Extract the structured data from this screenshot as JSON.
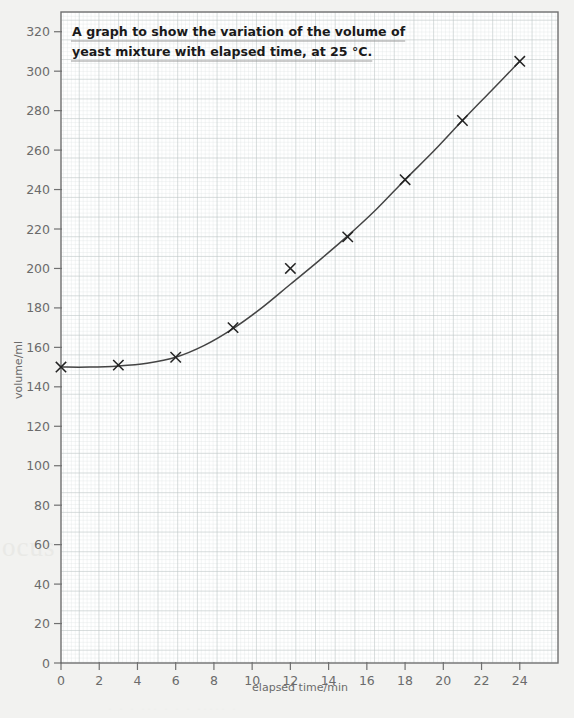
{
  "chart_data": {
    "type": "scatter",
    "title": "A graph to show the variation of the volume of yeast mixture with elapsed time, at 25 °C.",
    "title_lines": [
      "A graph to show the variation of the volume of",
      "yeast mixture with elapsed time, at 25 °C."
    ],
    "xlabel": "elapsed time/min",
    "ylabel": "volume/ml",
    "xlim": [
      0,
      26
    ],
    "ylim": [
      0,
      330
    ],
    "xticks": [
      0,
      2,
      4,
      6,
      8,
      10,
      12,
      14,
      16,
      18,
      20,
      22,
      24
    ],
    "yticks": [
      0,
      20,
      40,
      60,
      80,
      100,
      120,
      140,
      160,
      180,
      200,
      220,
      240,
      260,
      280,
      300,
      320
    ],
    "grid": "graph-paper minor 1 unit / major 5 unit",
    "legend": "none",
    "marker": "cross",
    "x": [
      0,
      3,
      6,
      9,
      12,
      15,
      18,
      21,
      24
    ],
    "values": [
      150,
      151,
      155,
      170,
      200,
      216,
      245,
      275,
      305
    ],
    "points": [
      {
        "x": 0,
        "y": 150
      },
      {
        "x": 3,
        "y": 151
      },
      {
        "x": 6,
        "y": 155
      },
      {
        "x": 9,
        "y": 170
      },
      {
        "x": 12,
        "y": 200
      },
      {
        "x": 15,
        "y": 216
      },
      {
        "x": 18,
        "y": 245
      },
      {
        "x": 21,
        "y": 275
      },
      {
        "x": 24,
        "y": 305
      }
    ],
    "best_fit_curve": [
      {
        "x": 0,
        "y": 150
      },
      {
        "x": 1.5,
        "y": 150
      },
      {
        "x": 3,
        "y": 150.6
      },
      {
        "x": 4.5,
        "y": 152
      },
      {
        "x": 6,
        "y": 155
      },
      {
        "x": 7.5,
        "y": 161
      },
      {
        "x": 9,
        "y": 169.5
      },
      {
        "x": 10.5,
        "y": 180
      },
      {
        "x": 12,
        "y": 192
      },
      {
        "x": 13.5,
        "y": 204
      },
      {
        "x": 15,
        "y": 216.5
      },
      {
        "x": 16.5,
        "y": 230
      },
      {
        "x": 18,
        "y": 245
      },
      {
        "x": 19.5,
        "y": 259.5
      },
      {
        "x": 21,
        "y": 275
      },
      {
        "x": 22.5,
        "y": 290
      },
      {
        "x": 24,
        "y": 305
      }
    ],
    "outlier_note": "point at x=12 (200 ml) lies above the line of best fit",
    "colors": {
      "page_background": "#f2f2f0",
      "plot_background": "#ffffff",
      "minor_grid": "#dfe4e4",
      "major_grid": "#b9c2c2",
      "frame": "#707070",
      "curve": "#444444",
      "marker": "#222222",
      "tick_label": "#6b6b6b",
      "title_text": "#1a1a1a"
    }
  },
  "ghost_text": {
    "left_watermark": "ocus",
    "bottom_watermark": "·  ·   ·    ···  ·  ·   ·  ····· ·"
  }
}
